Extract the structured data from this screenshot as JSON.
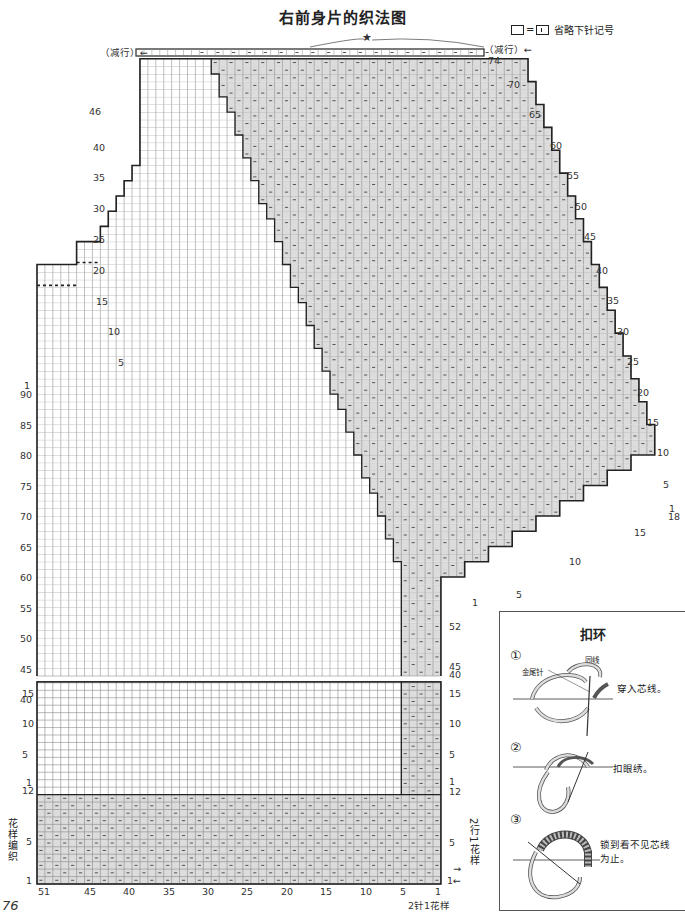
{
  "title": "右前身片的织法图",
  "legend": {
    "text": "省略下针记号",
    "equals": "="
  },
  "top_annotations": {
    "left_decrease": "（减行）←",
    "right_decrease": "（减行）←",
    "star": "★",
    "top_row_label": "74"
  },
  "left_row_labels": {
    "upper": [
      "46",
      "40",
      "35",
      "30",
      "25",
      "20",
      "15",
      "10",
      "5"
    ],
    "shoulder_top": "1",
    "body_upper": [
      "90",
      "85",
      "80",
      "75",
      "70",
      "65",
      "60",
      "55",
      "50",
      "45",
      "40"
    ],
    "body_lower": [
      "15",
      "10",
      "5",
      "1"
    ],
    "pattern": [
      "12",
      "5",
      "1"
    ]
  },
  "right_row_labels": {
    "decrease_numbers": [
      "70",
      "65",
      "60",
      "55",
      "50",
      "45",
      "40",
      "35",
      "30",
      "25",
      "20",
      "15",
      "10",
      "5"
    ],
    "decrease_start": "1",
    "bottom_edge": [
      "18",
      "15",
      "10",
      "5",
      "1"
    ],
    "band_upper": [
      "52",
      "45",
      "40"
    ],
    "band_lower": [
      "15",
      "10",
      "5",
      "1"
    ],
    "pattern": [
      "12",
      "5"
    ],
    "pattern_bottom": "1←",
    "pattern_arrow": "→"
  },
  "bottom_stitch_labels": [
    "51",
    "45",
    "40",
    "35",
    "30",
    "25",
    "20",
    "15",
    "10",
    "5",
    "1"
  ],
  "pattern_notes": {
    "left": "花样编织",
    "right_rows": "2行1花样",
    "bottom_repeat": "2针1花样"
  },
  "page_number": "76",
  "info_box": {
    "title": "扣环",
    "steps": [
      {
        "num": "①",
        "text": "穿入芯线。",
        "tags": [
          "同线",
          "金尾针"
        ]
      },
      {
        "num": "②",
        "text": "扣眼绣。"
      },
      {
        "num": "③",
        "text": "锁到看不见芯线为止。"
      }
    ]
  },
  "colors": {
    "line": "#222222",
    "grid": "#8a8a8a",
    "shade": "#dcdcdc"
  }
}
